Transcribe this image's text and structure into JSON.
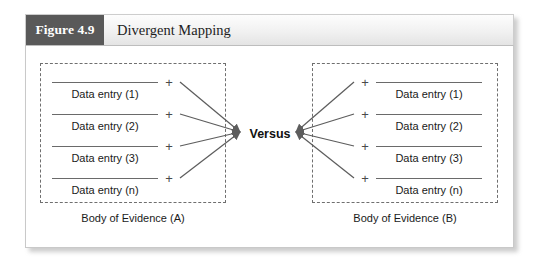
{
  "figure": {
    "tag": "Figure 4.9",
    "title": "Divergent Mapping"
  },
  "diagram": {
    "center_label": "Versus",
    "plus_symbol": "+",
    "groups": [
      {
        "id": "a",
        "caption": "Body of Evidence (A)",
        "side": "left",
        "entries": [
          {
            "label": "Data entry (1)"
          },
          {
            "label": "Data entry (2)"
          },
          {
            "label": "Data entry (3)"
          },
          {
            "label": "Data entry (n)"
          }
        ]
      },
      {
        "id": "b",
        "caption": "Body of Evidence (B)",
        "side": "right",
        "entries": [
          {
            "label": "Data entry (1)"
          },
          {
            "label": "Data entry (2)"
          },
          {
            "label": "Data entry (3)"
          },
          {
            "label": "Data entry (n)"
          }
        ]
      }
    ]
  },
  "colors": {
    "tag_background": "#595959",
    "tag_text": "#ffffff",
    "header_text": "#1d1d1d",
    "line": "#6a6a6a",
    "dashed_border": "#6f6f6f",
    "card_background": "#ffffff",
    "page_background": "#ffffff"
  }
}
